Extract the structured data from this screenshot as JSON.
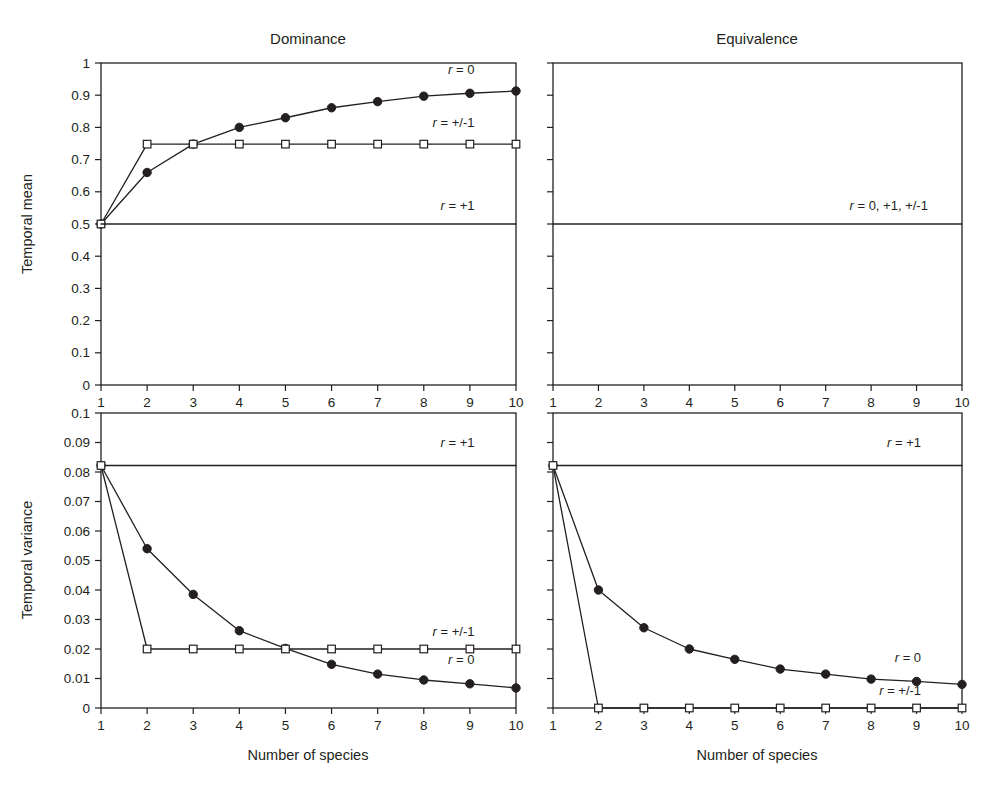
{
  "figure": {
    "xlabel": "Number of species",
    "panel_titles": [
      "Dominance",
      "Equivalence"
    ],
    "ylabels": [
      "Temporal mean",
      "Temporal variance"
    ],
    "x_tick_labels": [
      "1",
      "2",
      "3",
      "4",
      "5",
      "6",
      "7",
      "8",
      "9",
      "10"
    ],
    "mean_y_tick_labels": [
      "0",
      "0.1",
      "0.2",
      "0.3",
      "0.4",
      "0.5",
      "0.6",
      "0.7",
      "0.8",
      "0.9",
      "1"
    ],
    "variance_y_tick_labels": [
      "0",
      "0.01",
      "0.02",
      "0.03",
      "0.04",
      "0.05",
      "0.06",
      "0.07",
      "0.08",
      "0.09",
      "0.1"
    ],
    "ink_color": "#231f20",
    "background_color": "#ffffff"
  },
  "chart_data": [
    {
      "type": "line",
      "id": "dominance-temporal-mean",
      "title": "Dominance",
      "xlabel": "Number of species",
      "ylabel": "Temporal mean",
      "x": [
        1,
        2,
        3,
        4,
        5,
        6,
        7,
        8,
        9,
        10
      ],
      "xlim": [
        1,
        10
      ],
      "ylim": [
        0,
        1
      ],
      "yticks": [
        0,
        0.1,
        0.2,
        0.3,
        0.4,
        0.5,
        0.6,
        0.7,
        0.8,
        0.9,
        1
      ],
      "grid": false,
      "legend": "inline-annotations",
      "series": [
        {
          "name": "r = 0",
          "label": "r = 0",
          "marker": "filled-circle",
          "label_x": 9.1,
          "label_y": 0.965,
          "values": [
            0.5,
            0.66,
            0.748,
            0.8,
            0.83,
            0.861,
            0.88,
            0.897,
            0.906,
            0.913
          ]
        },
        {
          "name": "r = +/-1",
          "label": "r = +/-1",
          "marker": "open-square",
          "label_x": 9.1,
          "label_y": 0.8,
          "values": [
            0.5,
            0.748,
            0.748,
            0.748,
            0.748,
            0.748,
            0.748,
            0.748,
            0.748,
            0.748
          ]
        },
        {
          "name": "r = +1",
          "label": "r = +1",
          "marker": "none",
          "label_x": 9.1,
          "label_y": 0.545,
          "values": [
            0.5,
            0.5,
            0.5,
            0.5,
            0.5,
            0.5,
            0.5,
            0.5,
            0.5,
            0.5
          ]
        }
      ]
    },
    {
      "type": "line",
      "id": "equivalence-temporal-mean",
      "title": "Equivalence",
      "xlabel": "Number of species",
      "ylabel": "Temporal mean",
      "x": [
        1,
        2,
        3,
        4,
        5,
        6,
        7,
        8,
        9,
        10
      ],
      "xlim": [
        1,
        10
      ],
      "ylim": [
        0,
        1
      ],
      "yticks": [
        0,
        0.1,
        0.2,
        0.3,
        0.4,
        0.5,
        0.6,
        0.7,
        0.8,
        0.9,
        1
      ],
      "grid": false,
      "legend": "inline-annotations",
      "series": [
        {
          "name": "r = 0, +1, +/-1",
          "label": "r = 0, +1, +/-1",
          "marker": "none",
          "label_x": 9.25,
          "label_y": 0.545,
          "values": [
            0.5,
            0.5,
            0.5,
            0.5,
            0.5,
            0.5,
            0.5,
            0.5,
            0.5,
            0.5
          ]
        }
      ]
    },
    {
      "type": "line",
      "id": "dominance-temporal-variance",
      "title": "Dominance",
      "xlabel": "Number of species",
      "ylabel": "Temporal variance",
      "x": [
        1,
        2,
        3,
        4,
        5,
        6,
        7,
        8,
        9,
        10
      ],
      "xlim": [
        1,
        10
      ],
      "ylim": [
        0,
        0.1
      ],
      "yticks": [
        0,
        0.01,
        0.02,
        0.03,
        0.04,
        0.05,
        0.06,
        0.07,
        0.08,
        0.09,
        0.1
      ],
      "grid": false,
      "legend": "inline-annotations",
      "series": [
        {
          "name": "r = +1",
          "label": "r = +1",
          "marker": "none",
          "label_x": 9.1,
          "label_y": 0.0885,
          "values": [
            0.0822,
            0.0822,
            0.0822,
            0.0822,
            0.0822,
            0.0822,
            0.0822,
            0.0822,
            0.0822,
            0.0822
          ]
        },
        {
          "name": "r = 0",
          "label": "r = 0",
          "marker": "filled-circle",
          "label_x": 9.1,
          "label_y": 0.0148,
          "values": [
            0.0822,
            0.054,
            0.0385,
            0.0262,
            0.0202,
            0.0148,
            0.0115,
            0.0095,
            0.0082,
            0.0068
          ]
        },
        {
          "name": "r = +/-1",
          "label": "r = +/-1",
          "marker": "open-square",
          "label_x": 9.1,
          "label_y": 0.0245,
          "values": [
            0.0822,
            0.02,
            0.02,
            0.02,
            0.02,
            0.02,
            0.02,
            0.02,
            0.02,
            0.02
          ]
        }
      ]
    },
    {
      "type": "line",
      "id": "equivalence-temporal-variance",
      "title": "Equivalence",
      "xlabel": "Number of species",
      "ylabel": "Temporal variance",
      "x": [
        1,
        2,
        3,
        4,
        5,
        6,
        7,
        8,
        9,
        10
      ],
      "xlim": [
        1,
        10
      ],
      "ylim": [
        0,
        0.1
      ],
      "yticks": [
        0,
        0.01,
        0.02,
        0.03,
        0.04,
        0.05,
        0.06,
        0.07,
        0.08,
        0.09,
        0.1
      ],
      "grid": false,
      "legend": "inline-annotations",
      "series": [
        {
          "name": "r = +1",
          "label": "r = +1",
          "marker": "none",
          "label_x": 9.1,
          "label_y": 0.0885,
          "values": [
            0.0822,
            0.0822,
            0.0822,
            0.0822,
            0.0822,
            0.0822,
            0.0822,
            0.0822,
            0.0822,
            0.0822
          ]
        },
        {
          "name": "r = 0",
          "label": "r = 0",
          "marker": "filled-circle",
          "label_x": 9.1,
          "label_y": 0.0155,
          "values": [
            0.0822,
            0.04,
            0.0272,
            0.02,
            0.0165,
            0.0132,
            0.0115,
            0.0098,
            0.009,
            0.008
          ]
        },
        {
          "name": "r = +/-1",
          "label": "r = +/-1",
          "marker": "open-square",
          "label_x": 9.1,
          "label_y": 0.0043,
          "values": [
            0.0822,
            0.0,
            0.0,
            0.0,
            0.0,
            0.0,
            0.0,
            0.0,
            0.0,
            0.0
          ]
        }
      ]
    }
  ]
}
